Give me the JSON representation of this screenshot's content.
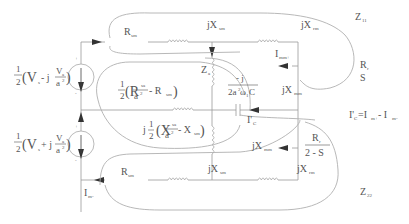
{
  "diagram": {
    "type": "equivalent-circuit",
    "sources": {
      "top": {
        "half": "1",
        "den": "2",
        "expr_open": "(V",
        "v_sub": "s",
        "minus_j": " - j",
        "frac_num": "V",
        "frac_num_sub": "a",
        "frac_den": "a",
        "frac_den_sup": "2",
        "close": ")",
        "plus": "+",
        "minus": "-"
      },
      "bottom": {
        "half": "1",
        "den": "2",
        "expr_open": "(V",
        "v_sub": "s",
        "plus_j": " + j",
        "frac_num": "V",
        "frac_num_sub": "a",
        "frac_den": "a",
        "frac_den_sup": "2",
        "close": ")",
        "plus": "+",
        "minus": "-"
      }
    },
    "top_branch": {
      "r_label": "R",
      "r_sub": "sm",
      "x1_label": "jX",
      "x1_sub": "sm",
      "x2_label": "jX",
      "x2_sub": "rm",
      "z_label": "Z",
      "z_sub": "11",
      "current": "I",
      "current_sub": "mm+",
      "mag_label": "jX",
      "mag_sub": "mm",
      "rotor_num": "R",
      "rotor_num_sub": "r",
      "rotor_den": "S"
    },
    "middle_branch": {
      "za_label": "Z",
      "za_sub": "a",
      "r_half": "1",
      "r_half_den": "2",
      "r_expr": "(R",
      "r_expr_sub": "sa",
      "r_frac_den": "a",
      "r_frac_den_sup": "2",
      "r_minus": " - R",
      "r_minus_sub": "sm",
      "r_close": ")",
      "x_j": "j",
      "x_half": "1",
      "x_half_den": "2",
      "x_expr": "(X",
      "x_expr_sub": "sa",
      "x_frac_den": "a",
      "x_frac_den_sup": "2",
      "x_minus": " - X",
      "x_minus_sub": "sm",
      "x_close": ")",
      "cap_num": "- j",
      "cap_den": "2a",
      "cap_den_sup": "2",
      "cap_den_rest": "ω",
      "cap_den_sub": "1",
      "cap_den_end": "C",
      "current": "I'",
      "current_sub": "C",
      "relation": "I'",
      "relation_sub": "C",
      "relation_eq": "=I",
      "relation_sub2": "m+",
      "relation_minus": " - I",
      "relation_sub3": "m-"
    },
    "bottom_branch": {
      "r_label": "R",
      "r_sub": "sm",
      "x1_label": "jX",
      "x1_sub": "sm",
      "x2_label": "jX",
      "x2_sub": "rm",
      "z_label": "Z",
      "z_sub": "22",
      "current": "I",
      "current_sub": "m-",
      "mag_label": "jX",
      "mag_sub": "mm",
      "rotor_num": "R",
      "rotor_num_sub": "r",
      "rotor_den": "2 - S"
    },
    "colors": {
      "wire": "#9a9a9a",
      "loop": "#b0b0b0",
      "text": "#555555",
      "arrow": "#333333",
      "background": "#ffffff"
    }
  }
}
